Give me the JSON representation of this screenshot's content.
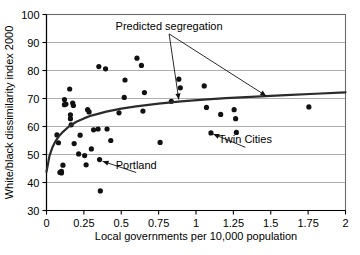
{
  "chart_data": {
    "type": "scatter",
    "title": "",
    "xlabel": "Local governments per 10,000 population",
    "ylabel": "White/black dissimilarity index 2000",
    "xlim": [
      0,
      2
    ],
    "ylim": [
      30,
      100
    ],
    "xticks": [
      "0",
      "0.25",
      "0.5",
      "0.75",
      "1",
      "1.25",
      "1.5",
      "1.75",
      "2"
    ],
    "xtick_values": [
      0,
      0.25,
      0.5,
      0.75,
      1,
      1.25,
      1.5,
      1.75,
      2
    ],
    "yticks": [
      "30",
      "40",
      "50",
      "60",
      "70",
      "80",
      "90",
      "100"
    ],
    "ytick_values": [
      30,
      40,
      50,
      60,
      70,
      80,
      90,
      100
    ],
    "grid": true,
    "grid_axis": "y",
    "legend": "none",
    "marker_color": "#111111",
    "curve_color": "#2b2b2b",
    "grid_color": "#9a9a9a",
    "series": [
      {
        "name": "Metropolitan areas",
        "marker": "filled-circle",
        "points": [
          [
            0.07,
            57.0
          ],
          [
            0.08,
            54.2
          ],
          [
            0.09,
            43.6
          ],
          [
            0.1,
            43.4
          ],
          [
            0.1,
            44.0
          ],
          [
            0.11,
            46.2
          ],
          [
            0.12,
            67.8
          ],
          [
            0.12,
            69.6
          ],
          [
            0.13,
            68.0
          ],
          [
            0.155,
            73.4
          ],
          [
            0.16,
            64.2
          ],
          [
            0.16,
            62.8
          ],
          [
            0.165,
            60.6
          ],
          [
            0.175,
            68.4
          ],
          [
            0.18,
            67.5
          ],
          [
            0.185,
            53.9
          ],
          [
            0.215,
            50.2
          ],
          [
            0.225,
            56.9
          ],
          [
            0.255,
            49.6
          ],
          [
            0.265,
            46.3
          ],
          [
            0.275,
            66.0
          ],
          [
            0.285,
            65.2
          ],
          [
            0.3,
            52.0
          ],
          [
            0.315,
            58.8
          ],
          [
            0.345,
            59.1
          ],
          [
            0.35,
            81.4
          ],
          [
            0.355,
            48.2
          ],
          [
            0.36,
            37.0
          ],
          [
            0.395,
            80.6
          ],
          [
            0.405,
            59.1
          ],
          [
            0.43,
            55.0
          ],
          [
            0.485,
            64.9
          ],
          [
            0.52,
            70.4
          ],
          [
            0.525,
            76.6
          ],
          [
            0.605,
            84.4
          ],
          [
            0.635,
            81.8
          ],
          [
            0.645,
            65.5
          ],
          [
            0.655,
            72.1
          ],
          [
            0.76,
            54.3
          ],
          [
            0.835,
            69.0
          ],
          [
            0.885,
            76.9
          ],
          [
            0.895,
            73.8
          ],
          [
            1.055,
            74.5
          ],
          [
            1.07,
            66.8
          ],
          [
            1.1,
            57.7
          ],
          [
            1.165,
            64.3
          ],
          [
            1.255,
            66.0
          ],
          [
            1.265,
            62.8
          ],
          [
            1.27,
            57.9
          ],
          [
            1.755,
            67.0
          ]
        ]
      }
    ],
    "fit_curve": {
      "name": "Predicted segregation",
      "description": "logarithmic fit rising from about 44 at x=0 to about 72 at x=2",
      "points": [
        [
          0.0,
          43.8
        ],
        [
          0.02,
          49.5
        ],
        [
          0.04,
          52.6
        ],
        [
          0.06,
          54.7
        ],
        [
          0.08,
          56.3
        ],
        [
          0.11,
          58.1
        ],
        [
          0.15,
          60.0
        ],
        [
          0.2,
          61.7
        ],
        [
          0.25,
          62.9
        ],
        [
          0.3,
          63.9
        ],
        [
          0.4,
          65.3
        ],
        [
          0.5,
          66.4
        ],
        [
          0.6,
          67.2
        ],
        [
          0.75,
          68.2
        ],
        [
          0.9,
          69.0
        ],
        [
          1.05,
          69.6
        ],
        [
          1.2,
          70.1
        ],
        [
          1.4,
          70.7
        ],
        [
          1.6,
          71.2
        ],
        [
          1.8,
          71.7
        ],
        [
          2.0,
          72.2
        ]
      ]
    },
    "annotations": [
      {
        "id": "predicted-segregation",
        "label": "Predicted segregation",
        "label_x": 0.82,
        "label_y": 94.5,
        "targets": [
          {
            "x": 0.885,
            "y": 69.6
          },
          {
            "x": 1.47,
            "y": 70.9
          }
        ]
      },
      {
        "id": "twin-cities",
        "label": "Twin Cities",
        "label_x": 1.33,
        "label_y": 54.0,
        "targets": [
          {
            "x": 1.115,
            "y": 57.3
          }
        ]
      },
      {
        "id": "portland",
        "label": "Portland",
        "label_x": 0.6,
        "label_y": 45.0,
        "targets": [
          {
            "x": 0.375,
            "y": 47.6
          }
        ]
      }
    ]
  }
}
